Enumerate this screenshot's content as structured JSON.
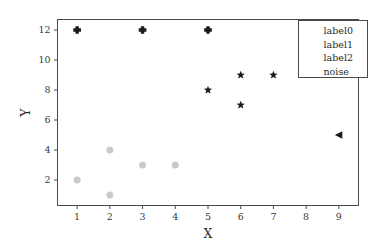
{
  "chart_data": {
    "type": "scatter",
    "title": "",
    "xlabel": "X",
    "ylabel": "Y",
    "xlim": [
      0.4,
      9.6
    ],
    "ylim": [
      0.3,
      12.7
    ],
    "xticks": [
      1,
      2,
      3,
      4,
      5,
      6,
      7,
      8,
      9
    ],
    "xtick_labels": [
      "1",
      "2",
      "3",
      "4",
      "5",
      "6",
      "7",
      "8",
      "9"
    ],
    "yticks": [
      2,
      4,
      6,
      8,
      10,
      12
    ],
    "ytick_labels": [
      "2",
      "4",
      "6",
      "8",
      "10",
      "12"
    ],
    "grid": false,
    "legend_position": "upper right",
    "series": [
      {
        "name": "label0",
        "marker": "circle",
        "color": "#c9c9c9",
        "size": 7,
        "x": [
          1,
          2,
          2,
          3,
          4
        ],
        "y": [
          2,
          4,
          1,
          3,
          3
        ],
        "points": [
          [
            1,
            2
          ],
          [
            2,
            4
          ],
          [
            2,
            1
          ],
          [
            3,
            3
          ],
          [
            4,
            3
          ]
        ]
      },
      {
        "name": "label1",
        "marker": "star",
        "color": "#1a1a1a",
        "size": 7,
        "x": [
          5,
          6,
          6,
          7
        ],
        "y": [
          8,
          9,
          7,
          9
        ],
        "points": [
          [
            5,
            8
          ],
          [
            6,
            9
          ],
          [
            6,
            7
          ],
          [
            7,
            9
          ]
        ]
      },
      {
        "name": "label2",
        "marker": "plus",
        "color": "#1a1a1a",
        "size": 7,
        "x": [
          1,
          3,
          5
        ],
        "y": [
          12,
          12,
          12
        ],
        "points": [
          [
            1,
            12
          ],
          [
            3,
            12
          ],
          [
            5,
            12
          ]
        ]
      },
      {
        "name": "noise",
        "marker": "triangle-left",
        "color": "#1a1a1a",
        "size": 7,
        "x": [
          9
        ],
        "y": [
          5
        ],
        "points": [
          [
            9,
            5
          ]
        ]
      }
    ]
  },
  "axes": {
    "xlabel": "X",
    "ylabel": "Y",
    "xtick_labels": [
      "1",
      "2",
      "3",
      "4",
      "5",
      "6",
      "7",
      "8",
      "9"
    ],
    "ytick_labels": [
      "2",
      "4",
      "6",
      "8",
      "10",
      "12"
    ],
    "frame_color": "#4a4a4a",
    "background": "#ffffff"
  },
  "legend": {
    "entries": [
      {
        "label": "label0",
        "marker": "circle",
        "color": "#c9c9c9"
      },
      {
        "label": "label1",
        "marker": "star",
        "color": "#1a1a1a"
      },
      {
        "label": "label2",
        "marker": "plus",
        "color": "#1a1a1a"
      },
      {
        "label": "noise",
        "marker": "triangle-left",
        "color": "#1a1a1a"
      }
    ]
  }
}
